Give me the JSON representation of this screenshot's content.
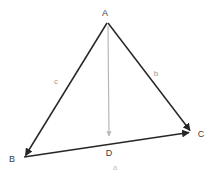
{
  "figure": {
    "kind": "geometry-diagram",
    "background_color": "#ffffff",
    "edge_color": "#262626",
    "altitude_color": "#b8b8b8",
    "vertex_label_color": "#3a3a3a",
    "side_label_color": "#9a9a9a",
    "faint_label_color": "#c4c4c4",
    "vertices": [
      {
        "id": "A",
        "label": "A",
        "x": 107,
        "y": 22,
        "label_x": 105,
        "label_y": 16
      },
      {
        "id": "B",
        "label": "B",
        "x": 24,
        "y": 157,
        "label_x": 10,
        "label_y": 162
      },
      {
        "id": "C",
        "label": "C",
        "x": 192,
        "y": 132,
        "label_x": 198,
        "label_y": 137
      },
      {
        "id": "D",
        "label": "D",
        "x": 109,
        "y": 144,
        "label_x": 105,
        "label_y": 156
      }
    ],
    "edges": [
      {
        "id": "AB",
        "label": "c",
        "from": "A",
        "to": "B",
        "arrow_at": "B",
        "label_x": 54,
        "label_y": 84,
        "color": "#262626"
      },
      {
        "id": "AC",
        "label": "b",
        "from": "A",
        "to": "C",
        "arrow_at": "C",
        "label_x": 153,
        "label_y": 76,
        "color": "#262626"
      },
      {
        "id": "BC",
        "label": "a",
        "from": "B",
        "to": "C",
        "arrow_at": "C",
        "label_x": 112,
        "label_y": 169,
        "color": "#262626"
      }
    ],
    "altitude": {
      "id": "AD",
      "from": "A",
      "to": "D",
      "arrow_at": "D",
      "color": "#b8b8b8"
    }
  }
}
